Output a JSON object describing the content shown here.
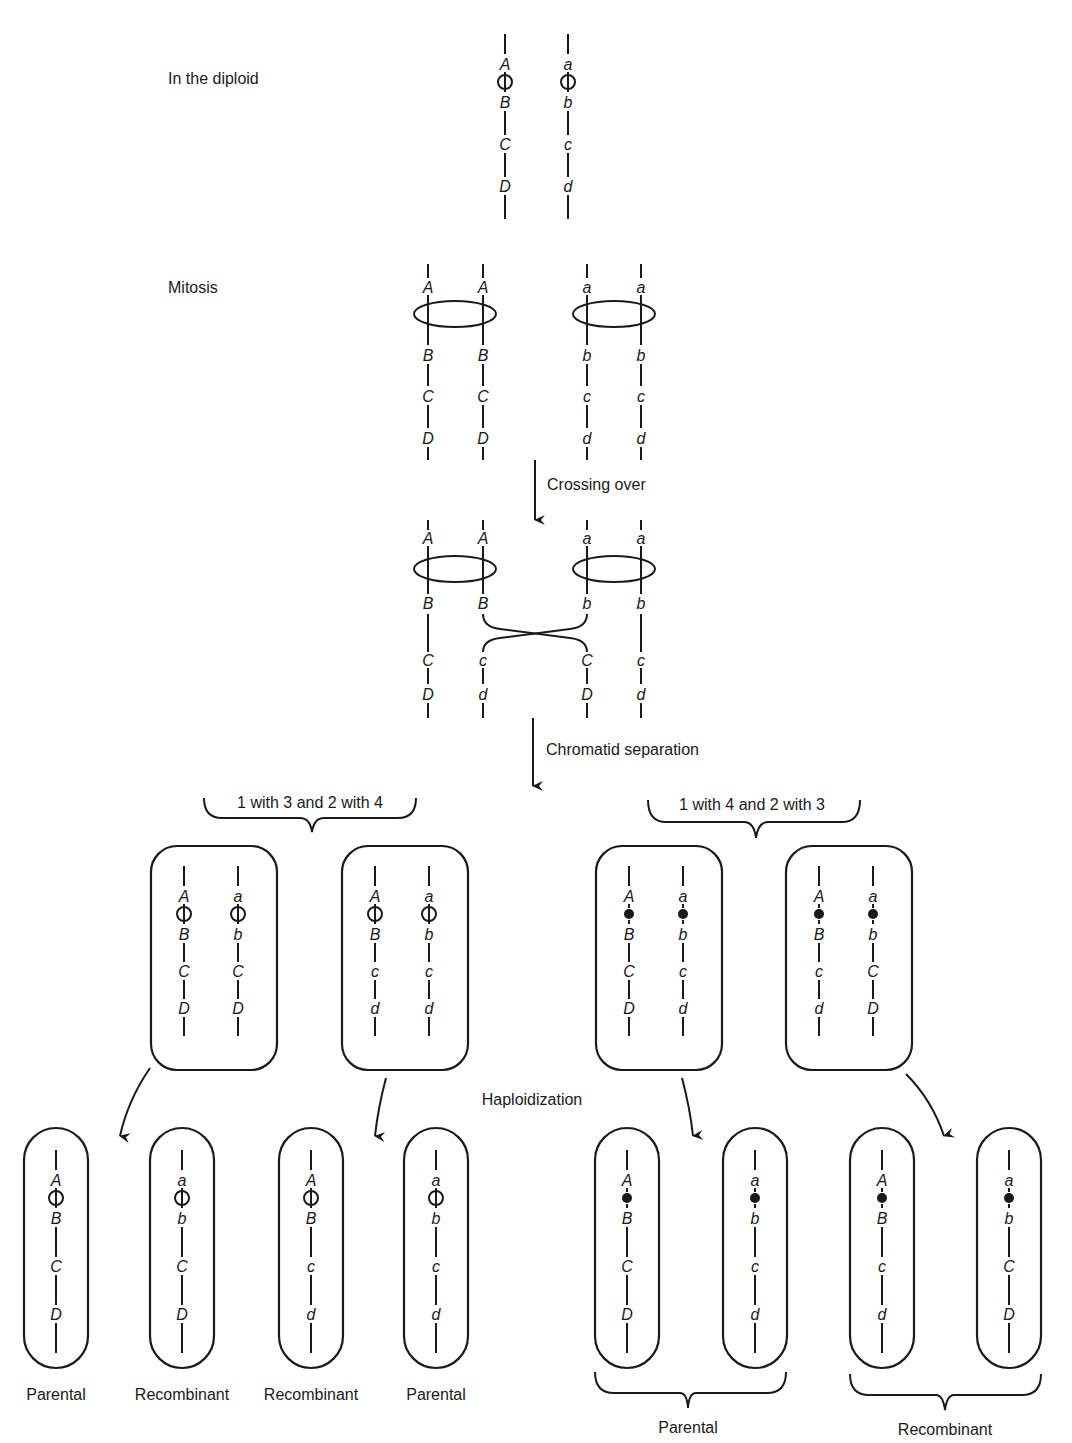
{
  "stages": {
    "diploid": "In the diploid",
    "mitosis": "Mitosis",
    "crossing_over": "Crossing over",
    "chromatid_separation": "Chromatid separation",
    "haploidization": "Haploidization"
  },
  "groupings": {
    "left": "1 with 3 and 2 with 4",
    "right": "1 with 4 and 2 with 3"
  },
  "centromere_types": {
    "left": "open-circle",
    "right": "filled-circle"
  },
  "diploid": {
    "chromosomes": [
      {
        "x": 505,
        "genes": [
          "A",
          "B",
          "C",
          "D"
        ]
      },
      {
        "x": 568,
        "genes": [
          "a",
          "b",
          "c",
          "d"
        ]
      }
    ]
  },
  "mitosis": {
    "chromatids": [
      {
        "x": 428,
        "genes": [
          "A",
          "B",
          "C",
          "D"
        ]
      },
      {
        "x": 483,
        "genes": [
          "A",
          "B",
          "C",
          "D"
        ]
      },
      {
        "x": 587,
        "genes": [
          "a",
          "b",
          "c",
          "d"
        ]
      },
      {
        "x": 641,
        "genes": [
          "a",
          "b",
          "c",
          "d"
        ]
      }
    ]
  },
  "crossover": {
    "chromatids": [
      {
        "x": 428,
        "top": [
          "A",
          "B"
        ],
        "bottom": [
          "C",
          "D"
        ]
      },
      {
        "x": 483,
        "top": [
          "A",
          "B"
        ],
        "bottom": [
          "c",
          "d"
        ]
      },
      {
        "x": 587,
        "top": [
          "a",
          "b"
        ],
        "bottom": [
          "C",
          "D"
        ]
      },
      {
        "x": 641,
        "top": [
          "a",
          "b"
        ],
        "bottom": [
          "c",
          "d"
        ]
      }
    ]
  },
  "daughter_nuclei": [
    {
      "x": 214,
      "chromatids": [
        [
          "A",
          "B",
          "C",
          "D"
        ],
        [
          "a",
          "b",
          "C",
          "D"
        ]
      ],
      "centromere": "open"
    },
    {
      "x": 405,
      "chromatids": [
        [
          "A",
          "B",
          "c",
          "d"
        ],
        [
          "a",
          "b",
          "c",
          "d"
        ]
      ],
      "centromere": "open"
    },
    {
      "x": 659,
      "chromatids": [
        [
          "A",
          "B",
          "C",
          "D"
        ],
        [
          "a",
          "b",
          "c",
          "d"
        ]
      ],
      "centromere": "filled"
    },
    {
      "x": 849,
      "chromatids": [
        [
          "A",
          "B",
          "c",
          "d"
        ],
        [
          "a",
          "b",
          "C",
          "D"
        ]
      ],
      "centromere": "filled"
    }
  ],
  "haploids": [
    {
      "x": 56,
      "genes": [
        "A",
        "B",
        "C",
        "D"
      ],
      "centromere": "open",
      "label": "Parental"
    },
    {
      "x": 182,
      "genes": [
        "a",
        "b",
        "C",
        "D"
      ],
      "centromere": "open",
      "label": "Recombinant"
    },
    {
      "x": 311,
      "genes": [
        "A",
        "B",
        "c",
        "d"
      ],
      "centromere": "open",
      "label": "Recombinant"
    },
    {
      "x": 436,
      "genes": [
        "a",
        "b",
        "c",
        "d"
      ],
      "centromere": "open",
      "label": "Parental"
    },
    {
      "x": 627,
      "genes": [
        "A",
        "B",
        "C",
        "D"
      ],
      "centromere": "filled",
      "label": ""
    },
    {
      "x": 755,
      "genes": [
        "a",
        "b",
        "c",
        "d"
      ],
      "centromere": "filled",
      "label": ""
    },
    {
      "x": 882,
      "genes": [
        "A",
        "B",
        "c",
        "d"
      ],
      "centromere": "filled",
      "label": ""
    },
    {
      "x": 1009,
      "genes": [
        "a",
        "b",
        "C",
        "D"
      ],
      "centromere": "filled",
      "label": ""
    }
  ],
  "haploid_group_labels": {
    "right_parental": "Parental",
    "right_recombinant": "Recombinant"
  }
}
